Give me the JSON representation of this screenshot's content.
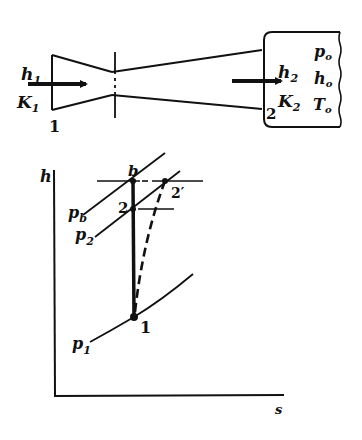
{
  "nozzle": {
    "inlet": {
      "enthalpy_label": "h",
      "enthalpy_sub": "1",
      "ke_label": "K",
      "ke_sub": "1",
      "station_label": "1"
    },
    "outlet": {
      "enthalpy_label": "h",
      "enthalpy_sub": "2",
      "ke_label": "K",
      "ke_sub": "2",
      "station_label": "2"
    },
    "reservoir": {
      "pressure_label": "p",
      "pressure_sub": "o",
      "enthalpy_label": "h",
      "enthalpy_sub": "o",
      "temperature_label": "T",
      "temperature_sub": "o"
    }
  },
  "hs_diagram": {
    "y_axis_label": "h",
    "x_axis_label": "s",
    "isobars": [
      {
        "label": "p",
        "sub": "b"
      },
      {
        "label": "p",
        "sub": "2"
      },
      {
        "label": "p",
        "sub": "1"
      }
    ],
    "points": [
      {
        "label": "b"
      },
      {
        "label": "2"
      },
      {
        "label": "2′"
      },
      {
        "label": "1"
      }
    ]
  },
  "colors": {
    "ink": "#111111",
    "background": "#ffffff"
  }
}
